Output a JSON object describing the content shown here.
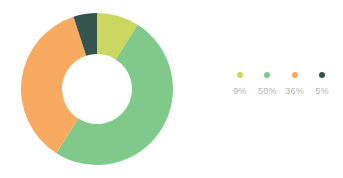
{
  "background": "#ffffff",
  "chart_data": {
    "type": "pie",
    "variant": "donut",
    "title": "",
    "subtitle": "",
    "xlabel": "",
    "ylabel": "",
    "legend_position": "right",
    "grid": false,
    "start_angle_deg": 0,
    "direction": "clockwise",
    "inner_radius_ratio": 0.46,
    "center": {
      "x": 96,
      "y": 89
    },
    "outer_radius": 76,
    "inner_radius": 35,
    "categories": [
      "9%",
      "50%",
      "36%",
      "5%"
    ],
    "values": [
      9,
      50,
      36,
      5
    ],
    "labels": [
      "9%",
      "50%",
      "36%",
      "5%"
    ],
    "colors": [
      "#ccd75f",
      "#7fc98b",
      "#f8aa61",
      "#34544d"
    ],
    "slices": [
      {
        "label": "9%",
        "value": 9,
        "color": "#ccd75f",
        "start_deg": 0,
        "end_deg": 32.4
      },
      {
        "label": "50%",
        "value": 50,
        "color": "#7fc98b",
        "start_deg": 32.4,
        "end_deg": 212.4
      },
      {
        "label": "36%",
        "value": 36,
        "color": "#f8aa61",
        "start_deg": 212.4,
        "end_deg": 342.0
      },
      {
        "label": "5%",
        "value": 5,
        "color": "#34544d",
        "start_deg": 342.0,
        "end_deg": 360.0
      }
    ],
    "total": 100
  },
  "legend": {
    "items": [
      {
        "label": "9%",
        "color": "#ccd75f",
        "icon": "legend-dot-icon"
      },
      {
        "label": "50%",
        "color": "#7fc98b",
        "icon": "legend-dot-icon"
      },
      {
        "label": "36%",
        "color": "#f8aa61",
        "icon": "legend-dot-icon"
      },
      {
        "label": "5%",
        "color": "#34544d",
        "icon": "legend-dot-icon"
      }
    ]
  }
}
